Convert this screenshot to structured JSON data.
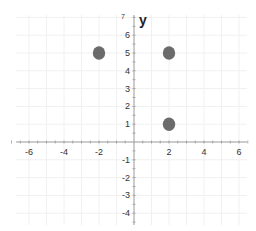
{
  "chart_data": {
    "type": "scatter",
    "title": "",
    "xlabel": "",
    "ylabel": "y",
    "xlim": [
      -7,
      6.5
    ],
    "ylim": [
      -4.5,
      7
    ],
    "grid": true,
    "legend": null,
    "x_ticks": [
      -6,
      -4,
      -2,
      2,
      4,
      6
    ],
    "y_ticks": [
      -4,
      -3,
      -2,
      -1,
      1,
      2,
      3,
      4,
      5,
      6
    ],
    "x_tick_labels": [
      "-6",
      "-4",
      "-2",
      "2",
      "4",
      "6"
    ],
    "y_tick_labels": [
      "-4",
      "-3",
      "-2",
      "-1",
      "1",
      "2",
      "3",
      "4",
      "5",
      "6"
    ],
    "top_partial_tick_label": "7",
    "series": [
      {
        "name": "points",
        "color": "#6b6b6b",
        "points": [
          {
            "x": -2,
            "y": 5
          },
          {
            "x": 2,
            "y": 5
          },
          {
            "x": 2,
            "y": 1
          }
        ]
      }
    ]
  },
  "colors": {
    "background": "#ffffff",
    "axis": "#9a9a9a",
    "grid": "#f0f0f0",
    "point": "#6b6b6b"
  }
}
